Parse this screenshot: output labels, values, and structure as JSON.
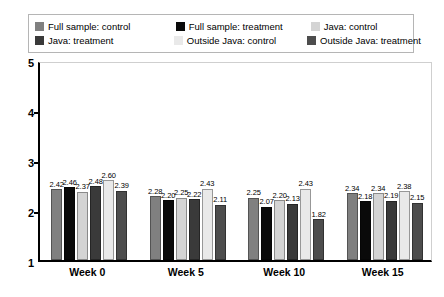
{
  "chart_data": {
    "type": "bar",
    "title": "",
    "xlabel": "",
    "ylabel": "",
    "ylim": [
      1,
      5
    ],
    "yticks": [
      "1",
      "2",
      "3",
      "4",
      "5"
    ],
    "grid": false,
    "legend_position": "top",
    "categories": [
      "Week 0",
      "Week 5",
      "Week 10",
      "Week 15"
    ],
    "series": [
      {
        "name": "Full sample: control",
        "color": "#808080",
        "values": [
          2.42,
          2.28,
          2.25,
          2.34
        ],
        "labels": [
          "2.42",
          "2.28",
          "2.25",
          "2.34"
        ]
      },
      {
        "name": "Full sample: treatment",
        "color": "#0a0a0a",
        "values": [
          2.46,
          2.2,
          2.07,
          2.18
        ],
        "labels": [
          "2.46",
          "2.20",
          "2.07",
          "2.18"
        ]
      },
      {
        "name": "Java: control",
        "color": "#d4d4d4",
        "values": [
          2.37,
          2.25,
          2.2,
          2.34
        ],
        "labels": [
          "2.37",
          "2.25",
          "2.20",
          "2.34"
        ]
      },
      {
        "name": "Java: treatment",
        "color": "#3a3a3a",
        "values": [
          2.48,
          2.22,
          2.13,
          2.19
        ],
        "labels": [
          "2.48",
          "2.22",
          "2.13",
          "2.19"
        ]
      },
      {
        "name": "Outside Java: control",
        "color": "#e9e9e9",
        "values": [
          2.6,
          2.43,
          2.43,
          2.38
        ],
        "labels": [
          "2.60",
          "2.43",
          "2.43",
          "2.38"
        ]
      },
      {
        "name": "Outside Java: treatment",
        "color": "#4d4d4d",
        "values": [
          2.39,
          2.11,
          1.82,
          2.15
        ],
        "labels": [
          "2.39",
          "2.11",
          "1.82",
          "2.15"
        ]
      }
    ]
  },
  "legend": {
    "rows": [
      [
        {
          "label": "Full sample: control",
          "color": "#808080"
        },
        {
          "label": "Full sample: treatment",
          "color": "#0a0a0a"
        },
        {
          "label": "Java: control",
          "color": "#d4d4d4"
        }
      ],
      [
        {
          "label": "Java: treatment",
          "color": "#3a3a3a"
        },
        {
          "label": "Outside Java: control",
          "color": "#e9e9e9"
        },
        {
          "label": "Outside Java: treatment",
          "color": "#4d4d4d"
        }
      ]
    ]
  }
}
